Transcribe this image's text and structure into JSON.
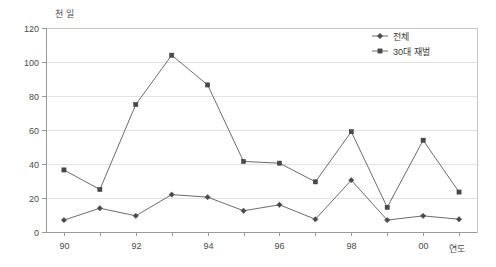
{
  "chart_data": {
    "type": "line",
    "title": "",
    "subtitle": "",
    "ylabel": "천 일",
    "xlabel": "연도",
    "ylim": [
      0,
      120
    ],
    "ytick_step": 20,
    "yticks": [
      "0",
      "20",
      "40",
      "60",
      "80",
      "100",
      "120"
    ],
    "grid": true,
    "grid_axis": "y",
    "legend_position": "top-right",
    "x": [
      "90",
      "91",
      "92",
      "93",
      "94",
      "95",
      "96",
      "97",
      "98",
      "99",
      "00",
      "01"
    ],
    "xticks_visible": [
      "90",
      "92",
      "94",
      "96",
      "98",
      "00"
    ],
    "categories": [
      "90",
      "91",
      "92",
      "93",
      "94",
      "95",
      "96",
      "97",
      "98",
      "99",
      "00",
      "01"
    ],
    "series": [
      {
        "name": "전체",
        "marker": "diamond",
        "color": "#4a4a4a",
        "values": [
          7,
          14,
          9.5,
          22,
          20.5,
          12.5,
          16,
          7.5,
          30.5,
          7,
          9.5,
          7.5
        ]
      },
      {
        "name": "30대 재벌",
        "marker": "square",
        "color": "#4a4a4a",
        "values": [
          36.5,
          25,
          75,
          104,
          86.5,
          41.5,
          40.5,
          29.5,
          59,
          14.5,
          54,
          23.5
        ]
      }
    ]
  },
  "legend": {
    "items": [
      {
        "label": "전체",
        "marker": "diamond"
      },
      {
        "label": "30대 재벌",
        "marker": "square"
      }
    ]
  },
  "colors": {
    "line": "#6b6b6b",
    "marker": "#4a4a4a",
    "grid": "#e2e2e2",
    "axis": "#9a9a9a",
    "plot_border": "#c8c8c8",
    "text": "#3a3a3a",
    "background": "#ffffff"
  }
}
